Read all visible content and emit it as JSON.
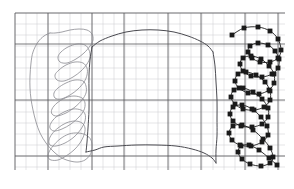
{
  "figure": {
    "title": "",
    "background_color": "#ffffff",
    "width": 294,
    "height": 189
  },
  "grid": {
    "x0": 15,
    "y0": 13,
    "x1": 285,
    "y1": 170,
    "minor_step_x": 11.0,
    "minor_step_y": 11.0,
    "minor_color": "#c9c9cf",
    "major_color": "#555558",
    "major_x": [
      15,
      48,
      92,
      124,
      168,
      201,
      245,
      278
    ],
    "major_y": [
      13,
      44,
      100,
      156
    ],
    "grid_on": true
  },
  "chart_data": {
    "type": "line",
    "title": "",
    "xlabel": "",
    "ylabel": "",
    "xlim": [
      15,
      285
    ],
    "ylim": [
      170,
      13
    ],
    "grid": true,
    "legend": "none",
    "series": [
      {
        "name": "left-tangled-trace",
        "color": "#8a8a90",
        "marker": "none",
        "linewidth": 0.8,
        "points": [
          [
            50,
            33
          ],
          [
            44,
            36
          ],
          [
            38,
            42
          ],
          [
            33,
            52
          ],
          [
            31,
            63
          ],
          [
            30,
            76
          ],
          [
            30,
            88
          ],
          [
            31,
            99
          ],
          [
            33,
            110
          ],
          [
            36,
            122
          ],
          [
            40,
            133
          ],
          [
            46,
            143
          ],
          [
            54,
            152
          ],
          [
            62,
            158
          ],
          [
            70,
            161
          ],
          [
            78,
            162
          ],
          [
            85,
            160
          ],
          [
            90,
            155
          ],
          [
            92,
            148
          ],
          [
            91,
            140
          ],
          [
            86,
            135
          ],
          [
            78,
            133
          ],
          [
            69,
            134
          ],
          [
            60,
            139
          ],
          [
            53,
            146
          ],
          [
            49,
            152
          ],
          [
            48,
            157
          ],
          [
            51,
            160
          ],
          [
            58,
            160
          ],
          [
            66,
            156
          ],
          [
            74,
            150
          ],
          [
            80,
            143
          ],
          [
            84,
            135
          ],
          [
            85,
            128
          ],
          [
            82,
            123
          ],
          [
            75,
            121
          ],
          [
            66,
            123
          ],
          [
            58,
            128
          ],
          [
            52,
            134
          ],
          [
            49,
            140
          ],
          [
            50,
            145
          ],
          [
            56,
            146
          ],
          [
            65,
            143
          ],
          [
            74,
            137
          ],
          [
            81,
            129
          ],
          [
            85,
            121
          ],
          [
            85,
            114
          ],
          [
            81,
            110
          ],
          [
            73,
            109
          ],
          [
            64,
            112
          ],
          [
            56,
            117
          ],
          [
            51,
            123
          ],
          [
            50,
            128
          ],
          [
            54,
            131
          ],
          [
            62,
            129
          ],
          [
            71,
            124
          ],
          [
            79,
            117
          ],
          [
            84,
            110
          ],
          [
            85,
            103
          ],
          [
            82,
            98
          ],
          [
            74,
            96
          ],
          [
            65,
            98
          ],
          [
            57,
            103
          ],
          [
            52,
            109
          ],
          [
            52,
            114
          ],
          [
            57,
            116
          ],
          [
            66,
            113
          ],
          [
            75,
            107
          ],
          [
            82,
            100
          ],
          [
            86,
            93
          ],
          [
            86,
            86
          ],
          [
            83,
            81
          ],
          [
            75,
            80
          ],
          [
            66,
            83
          ],
          [
            58,
            88
          ],
          [
            54,
            93
          ],
          [
            55,
            98
          ],
          [
            61,
            99
          ],
          [
            70,
            95
          ],
          [
            78,
            89
          ],
          [
            84,
            82
          ],
          [
            87,
            75
          ],
          [
            87,
            68
          ],
          [
            83,
            63
          ],
          [
            75,
            62
          ],
          [
            66,
            65
          ],
          [
            59,
            70
          ],
          [
            55,
            75
          ],
          [
            57,
            80
          ],
          [
            64,
            81
          ],
          [
            73,
            77
          ],
          [
            81,
            71
          ],
          [
            87,
            64
          ],
          [
            90,
            57
          ],
          [
            89,
            50
          ],
          [
            85,
            45
          ],
          [
            77,
            44
          ],
          [
            68,
            47
          ],
          [
            61,
            52
          ],
          [
            58,
            57
          ],
          [
            60,
            62
          ],
          [
            67,
            63
          ],
          [
            76,
            59
          ],
          [
            84,
            53
          ],
          [
            90,
            46
          ],
          [
            93,
            40
          ],
          [
            92,
            34
          ],
          [
            87,
            30
          ],
          [
            79,
            29
          ],
          [
            70,
            30
          ],
          [
            62,
            32
          ],
          [
            55,
            33
          ],
          [
            50,
            33
          ]
        ]
      },
      {
        "name": "central-envelope-top",
        "color": "#4a4a50",
        "marker": "none",
        "linewidth": 1.0,
        "points": [
          [
            92,
            47
          ],
          [
            100,
            41
          ],
          [
            112,
            36
          ],
          [
            126,
            32
          ],
          [
            142,
            30
          ],
          [
            158,
            30
          ],
          [
            174,
            32
          ],
          [
            188,
            36
          ],
          [
            200,
            41
          ],
          [
            208,
            46
          ],
          [
            213,
            52
          ]
        ]
      },
      {
        "name": "central-envelope-bottom",
        "color": "#4a4a50",
        "marker": "none",
        "linewidth": 1.0,
        "points": [
          [
            86,
            152
          ],
          [
            95,
            150
          ],
          [
            104,
            147
          ],
          [
            118,
            146
          ],
          [
            136,
            145
          ],
          [
            156,
            145
          ],
          [
            176,
            146
          ],
          [
            192,
            149
          ],
          [
            204,
            153
          ],
          [
            212,
            158
          ],
          [
            216,
            163
          ]
        ]
      },
      {
        "name": "central-left-riser",
        "color": "#4a4a50",
        "marker": "none",
        "linewidth": 1.0,
        "points": [
          [
            92,
            47
          ],
          [
            90,
            60
          ],
          [
            89,
            75
          ],
          [
            89,
            92
          ],
          [
            89,
            110
          ],
          [
            88,
            128
          ],
          [
            87,
            142
          ],
          [
            86,
            152
          ]
        ]
      },
      {
        "name": "central-right-riser",
        "color": "#4a4a50",
        "marker": "none",
        "linewidth": 1.0,
        "points": [
          [
            213,
            52
          ],
          [
            215,
            66
          ],
          [
            216,
            82
          ],
          [
            217,
            100
          ],
          [
            217,
            118
          ],
          [
            217,
            136
          ],
          [
            216,
            150
          ],
          [
            216,
            163
          ]
        ]
      },
      {
        "name": "right-marked-trace",
        "color": "#1a1a1a",
        "marker": "square",
        "marker_size": 2.4,
        "linewidth": 0.9,
        "points": [
          [
            232,
            35
          ],
          [
            244,
            28
          ],
          [
            258,
            27
          ],
          [
            270,
            31
          ],
          [
            278,
            39
          ],
          [
            281,
            50
          ],
          [
            278,
            58
          ],
          [
            270,
            62
          ],
          [
            260,
            62
          ],
          [
            252,
            58
          ],
          [
            248,
            52
          ],
          [
            250,
            46
          ],
          [
            258,
            43
          ],
          [
            268,
            45
          ],
          [
            275,
            51
          ],
          [
            279,
            59
          ],
          [
            278,
            68
          ],
          [
            272,
            74
          ],
          [
            262,
            77
          ],
          [
            251,
            76
          ],
          [
            243,
            71
          ],
          [
            240,
            64
          ],
          [
            243,
            58
          ],
          [
            251,
            56
          ],
          [
            261,
            59
          ],
          [
            269,
            66
          ],
          [
            274,
            74
          ],
          [
            274,
            83
          ],
          [
            269,
            90
          ],
          [
            259,
            94
          ],
          [
            248,
            93
          ],
          [
            239,
            88
          ],
          [
            235,
            81
          ],
          [
            238,
            74
          ],
          [
            246,
            72
          ],
          [
            256,
            75
          ],
          [
            265,
            82
          ],
          [
            270,
            91
          ],
          [
            270,
            100
          ],
          [
            264,
            107
          ],
          [
            254,
            110
          ],
          [
            243,
            109
          ],
          [
            235,
            104
          ],
          [
            231,
            97
          ],
          [
            234,
            90
          ],
          [
            243,
            88
          ],
          [
            253,
            92
          ],
          [
            262,
            99
          ],
          [
            268,
            108
          ],
          [
            268,
            117
          ],
          [
            262,
            124
          ],
          [
            252,
            127
          ],
          [
            241,
            126
          ],
          [
            233,
            121
          ],
          [
            230,
            114
          ],
          [
            233,
            107
          ],
          [
            242,
            105
          ],
          [
            252,
            109
          ],
          [
            261,
            117
          ],
          [
            267,
            126
          ],
          [
            268,
            135
          ],
          [
            262,
            142
          ],
          [
            251,
            146
          ],
          [
            240,
            145
          ],
          [
            232,
            140
          ],
          [
            229,
            133
          ],
          [
            233,
            126
          ],
          [
            242,
            125
          ],
          [
            253,
            130
          ],
          [
            263,
            139
          ],
          [
            270,
            148
          ],
          [
            273,
            157
          ],
          [
            270,
            163
          ],
          [
            261,
            166
          ],
          [
            250,
            164
          ],
          [
            242,
            159
          ],
          [
            238,
            152
          ],
          [
            241,
            146
          ],
          [
            249,
            145
          ],
          [
            259,
            150
          ],
          [
            269,
            158
          ],
          [
            277,
            165
          ]
        ]
      }
    ]
  }
}
